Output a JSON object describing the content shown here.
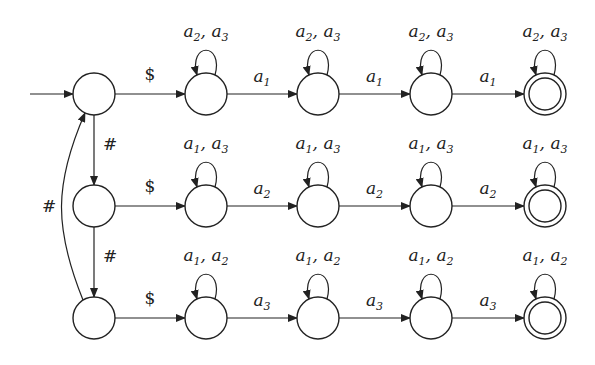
{
  "diagram": {
    "type": "finite-automaton",
    "columns_x": [
      94,
      206,
      318,
      431,
      545
    ],
    "rows_y": [
      94,
      206,
      318
    ],
    "radius": 21,
    "start_arrow": {
      "from_x": 30,
      "row": 0
    },
    "rows": [
      {
        "entry_label": "$",
        "loop_label": {
          "a": "a",
          "i": "2",
          "b": "a",
          "j": "3"
        },
        "transition_label": {
          "a": "a",
          "i": "1"
        }
      },
      {
        "entry_label": "$",
        "loop_label": {
          "a": "a",
          "i": "1",
          "b": "a",
          "j": "3"
        },
        "transition_label": {
          "a": "a",
          "i": "2"
        }
      },
      {
        "entry_label": "$",
        "loop_label": {
          "a": "a",
          "i": "1",
          "b": "a",
          "j": "2"
        },
        "transition_label": {
          "a": "a",
          "i": "3"
        }
      }
    ],
    "hash_label": "#",
    "back_edge_label": "#"
  }
}
